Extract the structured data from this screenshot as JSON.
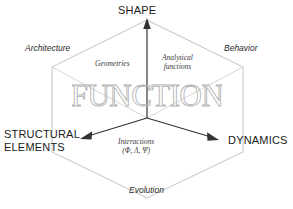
{
  "diagram": {
    "center_word": "FUNCTION",
    "axes": [
      {
        "id": "shape",
        "label": "SHAPE",
        "direction": "up"
      },
      {
        "id": "structural",
        "label": "STRUCTURAL\nELEMENTS",
        "direction": "lower-left",
        "line1": "STRUCTURAL",
        "line2": "ELEMENTS"
      },
      {
        "id": "dynamics",
        "label": "DYNAMICS",
        "direction": "lower-right"
      }
    ],
    "corner_labels": [
      {
        "id": "architecture",
        "label": "Architecture",
        "position": "upper-left"
      },
      {
        "id": "behavior",
        "label": "Behavior",
        "position": "upper-right"
      }
    ],
    "face_labels": [
      {
        "id": "geometries",
        "line1": "Geometries",
        "line2": "",
        "position": "top-left-face"
      },
      {
        "id": "analytical",
        "line1": "Analytical",
        "line2": "functions",
        "position": "top-right-face"
      },
      {
        "id": "interactions",
        "line1": "Interactions",
        "line2": "(Φ, Λ, Ψ)",
        "position": "bottom-face"
      }
    ],
    "bottom_label": {
      "id": "evolution",
      "label": "Evolution"
    },
    "colors": {
      "background": "#ffffff",
      "hexagon_outline": "#c8c8c8",
      "inner_edge": "#d5d5d5",
      "axis_arrow": "#333333",
      "text": "#1a1a1a",
      "word_outline": "#b0b0b0"
    }
  }
}
